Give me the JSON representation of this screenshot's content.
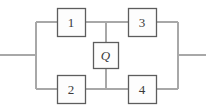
{
  "diagram": {
    "type": "bridge-network",
    "canvas": {
      "width": 206,
      "height": 112,
      "background": "#ffffff"
    },
    "colors": {
      "wire": "#a8a8a8",
      "box_border": "#5d5d5d",
      "box_fill": "#fdfdfd",
      "label_text": "#3a3a3a"
    },
    "geometry": {
      "left_bus_x": 36,
      "right_bus_x": 178,
      "middle_bus_x": 106,
      "top_rail_y": 22,
      "bottom_rail_y": 89,
      "terminal_y": 55,
      "box_width": 28,
      "box_height": 28,
      "bridge_box_width": 25,
      "bridge_box_height": 26
    },
    "components": [
      {
        "id": "block-1",
        "label": "1",
        "position": "top-left",
        "italic": false,
        "x": 57,
        "y": 8,
        "w": 28,
        "h": 28
      },
      {
        "id": "block-3",
        "label": "3",
        "position": "top-right",
        "italic": false,
        "x": 128,
        "y": 8,
        "w": 28,
        "h": 28
      },
      {
        "id": "block-q",
        "label": "Q",
        "position": "bridge-center",
        "italic": true,
        "x": 93,
        "y": 42,
        "w": 25,
        "h": 26
      },
      {
        "id": "block-2",
        "label": "2",
        "position": "bottom-left",
        "italic": false,
        "x": 57,
        "y": 75,
        "w": 28,
        "h": 28
      },
      {
        "id": "block-4",
        "label": "4",
        "position": "bottom-right",
        "italic": false,
        "x": 128,
        "y": 75,
        "w": 28,
        "h": 28
      }
    ],
    "terminals": {
      "left": {
        "x1": 0,
        "y1": 55,
        "x2": 36,
        "y2": 55
      },
      "right": {
        "x1": 178,
        "y1": 55,
        "x2": 206,
        "y2": 55
      }
    },
    "wires": [
      {
        "id": "left-bus",
        "d": "M36 22 L36 89"
      },
      {
        "id": "right-bus",
        "d": "M178 22 L178 89"
      },
      {
        "id": "top-rail-left",
        "d": "M36 22 L57 22"
      },
      {
        "id": "top-rail-mid-left",
        "d": "M85 22 L106 22"
      },
      {
        "id": "top-rail-mid-right",
        "d": "M106 22 L128 22"
      },
      {
        "id": "top-rail-right",
        "d": "M156 22 L178 22"
      },
      {
        "id": "bottom-rail-left",
        "d": "M36 89 L57 89"
      },
      {
        "id": "bottom-rail-mid-left",
        "d": "M85 89 L106 89"
      },
      {
        "id": "bottom-rail-mid-right",
        "d": "M106 89 L128 89"
      },
      {
        "id": "bottom-rail-right",
        "d": "M156 89 L178 89"
      },
      {
        "id": "bridge-upper",
        "d": "M106 22 L106 42"
      },
      {
        "id": "bridge-lower",
        "d": "M106 68 L106 89"
      },
      {
        "id": "terminal-left-lead",
        "d": "M0 55 L36 55"
      },
      {
        "id": "terminal-right-lead",
        "d": "M178 55 L206 55"
      }
    ]
  }
}
